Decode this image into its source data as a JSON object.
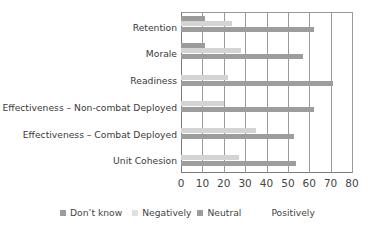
{
  "chart_data": {
    "type": "bar",
    "orientation": "horizontal",
    "title": "",
    "xlabel": "",
    "ylabel": "",
    "xlim": [
      0,
      80
    ],
    "xticks": [
      0,
      10,
      20,
      30,
      40,
      50,
      60,
      70,
      80
    ],
    "grid": true,
    "legend_position": "bottom",
    "categories": [
      "Retention",
      "Morale",
      "Readiness",
      "Effectiveness – Non-combat Deployed",
      "Effectiveness – Combat Deployed",
      "Unit Cohesion"
    ],
    "series": [
      {
        "name": "Don’t know",
        "color": "#9b9b9b",
        "values": [
          11,
          11,
          0,
          0,
          0,
          0
        ]
      },
      {
        "name": "Negatively",
        "color": "#d4d4d4",
        "values": [
          24,
          28,
          22,
          20,
          35,
          27
        ]
      },
      {
        "name": "Neutral",
        "color": "#9d9d9d",
        "values": [
          62,
          57,
          71,
          62,
          53,
          54
        ]
      },
      {
        "name": "Positively",
        "color": "#ffffff",
        "values": [
          0,
          0,
          0,
          0,
          0,
          0
        ]
      }
    ]
  },
  "labels": {
    "categories": [
      "Retention",
      "Morale",
      "Readiness",
      "Effectiveness – Non-combat Deployed",
      "Effectiveness – Combat Deployed",
      "Unit Cohesion"
    ],
    "xticks": [
      "0",
      "10",
      "20",
      "30",
      "40",
      "50",
      "60",
      "70",
      "80"
    ],
    "legend": [
      "Don’t know",
      "Negatively",
      "Neutral",
      "Positively"
    ]
  }
}
